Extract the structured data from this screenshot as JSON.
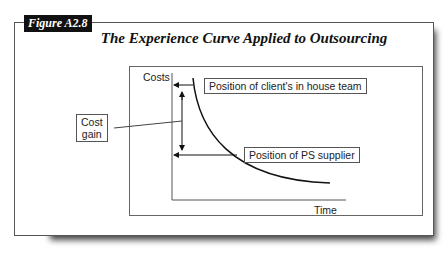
{
  "figure": {
    "label": "Figure A2.8",
    "title": "The Experience Curve Applied to Outsourcing"
  },
  "diagram": {
    "y_axis_label": "Costs",
    "x_axis_label": "Time",
    "cost_gain_box": [
      "Cost",
      "gain"
    ],
    "callouts": {
      "client": "Position of client's in house team",
      "supplier": "Position of PS supplier"
    }
  }
}
